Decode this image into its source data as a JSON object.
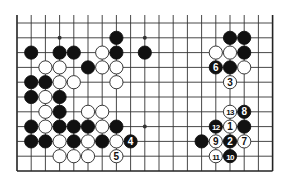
{
  "board": {
    "columns": 19,
    "rows": 11,
    "origin_x": 17,
    "origin_y": 23,
    "spacing_x": 14.2,
    "spacing_y": 14.8,
    "top_extension": 8,
    "open_top": true,
    "edges": [
      "left",
      "right",
      "bottom"
    ],
    "line_color": "#333333",
    "edge_color": "#222222",
    "background": "#ffffff",
    "star_points": [
      [
        3,
        1
      ],
      [
        9,
        1
      ],
      [
        15,
        1
      ],
      [
        3,
        7
      ],
      [
        9,
        7
      ],
      [
        15,
        7
      ]
    ]
  },
  "colors": {
    "black": "#111111",
    "white": "#ffffff",
    "white_stroke": "#222222"
  },
  "stones": [
    {
      "c": 7,
      "r": 1,
      "color": "black"
    },
    {
      "c": 15,
      "r": 1,
      "color": "black"
    },
    {
      "c": 16,
      "r": 1,
      "color": "black"
    },
    {
      "c": 1,
      "r": 2,
      "color": "black"
    },
    {
      "c": 3,
      "r": 2,
      "color": "black"
    },
    {
      "c": 4,
      "r": 2,
      "color": "black"
    },
    {
      "c": 6,
      "r": 2,
      "color": "white"
    },
    {
      "c": 7,
      "r": 2,
      "color": "black"
    },
    {
      "c": 9,
      "r": 2,
      "color": "black"
    },
    {
      "c": 14,
      "r": 2,
      "color": "white"
    },
    {
      "c": 15,
      "r": 2,
      "color": "white"
    },
    {
      "c": 16,
      "r": 2,
      "color": "black"
    },
    {
      "c": 2,
      "r": 3,
      "color": "white"
    },
    {
      "c": 3,
      "r": 3,
      "color": "white"
    },
    {
      "c": 5,
      "r": 3,
      "color": "black"
    },
    {
      "c": 6,
      "r": 3,
      "color": "white"
    },
    {
      "c": 7,
      "r": 3,
      "color": "white"
    },
    {
      "c": 14,
      "r": 3,
      "color": "black",
      "label": "6"
    },
    {
      "c": 15,
      "r": 3,
      "color": "black"
    },
    {
      "c": 16,
      "r": 3,
      "color": "white"
    },
    {
      "c": 1,
      "r": 4,
      "color": "black"
    },
    {
      "c": 2,
      "r": 4,
      "color": "black"
    },
    {
      "c": 3,
      "r": 4,
      "color": "white"
    },
    {
      "c": 4,
      "r": 4,
      "color": "white"
    },
    {
      "c": 7,
      "r": 4,
      "color": "white"
    },
    {
      "c": 15,
      "r": 4,
      "color": "white",
      "label": "3"
    },
    {
      "c": 1,
      "r": 5,
      "color": "black"
    },
    {
      "c": 2,
      "r": 5,
      "color": "white"
    },
    {
      "c": 3,
      "r": 5,
      "color": "black"
    },
    {
      "c": 2,
      "r": 6,
      "color": "white"
    },
    {
      "c": 3,
      "r": 6,
      "color": "black"
    },
    {
      "c": 5,
      "r": 6,
      "color": "white"
    },
    {
      "c": 6,
      "r": 6,
      "color": "white"
    },
    {
      "c": 15,
      "r": 6,
      "color": "white",
      "label": "13"
    },
    {
      "c": 16,
      "r": 6,
      "color": "black",
      "label": "8"
    },
    {
      "c": 1,
      "r": 7,
      "color": "black"
    },
    {
      "c": 2,
      "r": 7,
      "color": "white"
    },
    {
      "c": 3,
      "r": 7,
      "color": "black"
    },
    {
      "c": 4,
      "r": 7,
      "color": "black"
    },
    {
      "c": 5,
      "r": 7,
      "color": "black"
    },
    {
      "c": 6,
      "r": 7,
      "color": "white"
    },
    {
      "c": 7,
      "r": 7,
      "color": "black"
    },
    {
      "c": 14,
      "r": 7,
      "color": "black",
      "label": "12"
    },
    {
      "c": 15,
      "r": 7,
      "color": "white",
      "label": "1"
    },
    {
      "c": 16,
      "r": 7,
      "color": "black"
    },
    {
      "c": 1,
      "r": 8,
      "color": "black"
    },
    {
      "c": 2,
      "r": 8,
      "color": "black"
    },
    {
      "c": 3,
      "r": 8,
      "color": "white"
    },
    {
      "c": 4,
      "r": 8,
      "color": "black"
    },
    {
      "c": 5,
      "r": 8,
      "color": "white"
    },
    {
      "c": 6,
      "r": 8,
      "color": "black"
    },
    {
      "c": 7,
      "r": 8,
      "color": "white"
    },
    {
      "c": 8,
      "r": 8,
      "color": "black",
      "label": "4"
    },
    {
      "c": 13,
      "r": 8,
      "color": "black"
    },
    {
      "c": 14,
      "r": 8,
      "color": "white",
      "label": "9"
    },
    {
      "c": 15,
      "r": 8,
      "color": "black",
      "label": "2"
    },
    {
      "c": 16,
      "r": 8,
      "color": "white",
      "label": "7"
    },
    {
      "c": 3,
      "r": 9,
      "color": "white"
    },
    {
      "c": 4,
      "r": 9,
      "color": "white"
    },
    {
      "c": 5,
      "r": 9,
      "color": "white"
    },
    {
      "c": 7,
      "r": 9,
      "color": "white",
      "label": "5"
    },
    {
      "c": 14,
      "r": 9,
      "color": "white",
      "label": "11"
    },
    {
      "c": 15,
      "r": 9,
      "color": "black",
      "label": "10"
    }
  ]
}
